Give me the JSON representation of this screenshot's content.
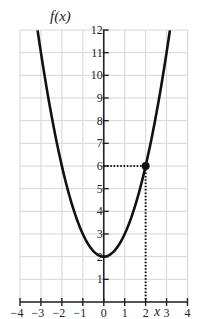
{
  "chart_data": {
    "type": "line",
    "title": "f(x)",
    "xlabel": "x",
    "ylabel": "f(x)",
    "function": "f(x) = x^2 + 2",
    "xlim": [
      -4,
      4
    ],
    "ylim": [
      0,
      12
    ],
    "grid": true,
    "x_ticks": [
      -4,
      -3,
      -2,
      -1,
      0,
      1,
      2,
      3,
      4
    ],
    "x_tick_labels": [
      "−4",
      "−3",
      "−2",
      "−1",
      "0",
      "1",
      "2",
      "3",
      "4"
    ],
    "y_ticks": [
      1,
      2,
      3,
      4,
      5,
      6,
      7,
      8,
      9,
      10,
      11,
      12
    ],
    "y_tick_labels": [
      "1",
      "2",
      "3",
      "4",
      "5",
      "6",
      "7",
      "8",
      "9",
      "10",
      "11",
      "12"
    ],
    "series": [
      {
        "name": "f(x)",
        "x": [
          -3.16,
          -3,
          -2.5,
          -2,
          -1.5,
          -1,
          -0.5,
          0,
          0.5,
          1,
          1.5,
          2,
          2.5,
          3,
          3.16
        ],
        "values": [
          12,
          11,
          8.25,
          6,
          4.25,
          3,
          2.25,
          2,
          2.25,
          3,
          4.25,
          6,
          8.25,
          11,
          12
        ]
      }
    ],
    "highlighted_point": {
      "x": 2,
      "y": 6
    },
    "annotations": [
      {
        "type": "dotted-line",
        "from": [
          0,
          6
        ],
        "to": [
          2,
          6
        ]
      },
      {
        "type": "dotted-line",
        "from": [
          2,
          6
        ],
        "to": [
          2,
          0
        ]
      }
    ]
  }
}
